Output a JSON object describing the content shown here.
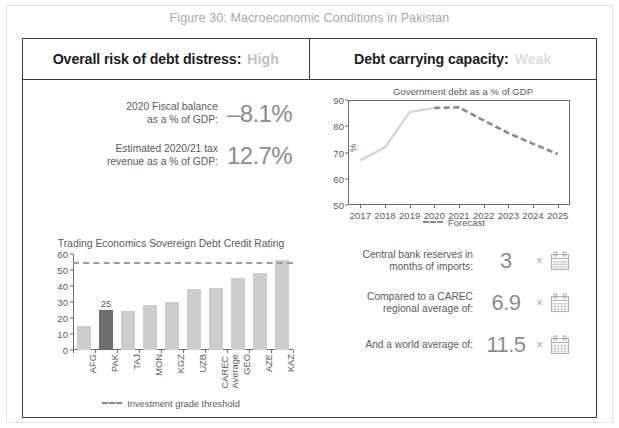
{
  "figure": {
    "title": "Figure 30: Macroeconomic Conditions in Pakistan"
  },
  "header": {
    "left_label": "Overall risk of debt distress:",
    "left_value": "High",
    "right_label": "Debt carrying capacity:",
    "right_value": "Weak"
  },
  "stats": [
    {
      "label_line1": "2020 Fiscal balance",
      "label_line2": "as a % of GDP:",
      "value": "–8.1%"
    },
    {
      "label_line1": "Estimated 2020/21 tax",
      "label_line2": "revenue as a % of GDP:",
      "value": "12.7%"
    }
  ],
  "reserves": [
    {
      "label_line1": "Central bank reserves in",
      "label_line2": "months of imports:",
      "value": "3",
      "multiplier": "×",
      "icon": "calendar-icon"
    },
    {
      "label_line1": "Compared to a CAREC",
      "label_line2": "regional average of:",
      "value": "6.9",
      "multiplier": "×",
      "icon": "calendar-icon"
    },
    {
      "label_line1": "And a world average of:",
      "label_line2": "",
      "value": "11.5",
      "multiplier": "×",
      "icon": "calendar-icon"
    }
  ],
  "colors": {
    "frame": "#3c3c3c",
    "text": "#5a5a5a",
    "value_gray": "#8c8c8c",
    "bar_default": "#cdcdcd",
    "bar_highlight": "#6e6e6e",
    "line_actual": "#d5d5d5",
    "line_forecast": "#8a8a8a"
  },
  "chart_data": [
    {
      "id": "government-debt-line-chart",
      "type": "line",
      "title": "Government debt as a % of GDP",
      "xlabel": "",
      "ylabel": "%",
      "ylim": [
        50,
        90
      ],
      "yticks": [
        50,
        60,
        70,
        80,
        90
      ],
      "x": [
        "2017",
        "2018",
        "2019",
        "2020",
        "2021",
        "2022",
        "2023",
        "2024",
        "2025"
      ],
      "grid": false,
      "legend_position": "bottom",
      "series": [
        {
          "name": "Actual",
          "style": "solid",
          "color": "#d5d5d5",
          "x": [
            "2017",
            "2018",
            "2019",
            "2020"
          ],
          "values": [
            67.0,
            72.0,
            85.4,
            87.0
          ]
        },
        {
          "name": "Forecast",
          "style": "dashed",
          "color": "#8a8a8a",
          "x": [
            "2020",
            "2021",
            "2022",
            "2023",
            "2024",
            "2025"
          ],
          "values": [
            87.0,
            87.2,
            82.2,
            77.4,
            73.3,
            69.4
          ]
        }
      ],
      "legend": [
        "Forecast"
      ]
    },
    {
      "id": "sovereign-debt-credit-rating-bar-chart",
      "type": "bar",
      "title": "Trading Economics Sovereign Debt Credit Rating",
      "xlabel": "",
      "ylabel": "",
      "ylim": [
        0,
        60
      ],
      "yticks": [
        0,
        10,
        20,
        30,
        40,
        50,
        60
      ],
      "categories": [
        "AFG",
        "PAK",
        "TAJ",
        "MON",
        "KGZ",
        "UZB",
        "CAREC Average",
        "GEO",
        "AZE",
        "KAZ"
      ],
      "values": [
        15,
        25,
        24.5,
        28,
        30,
        38,
        39,
        45,
        48,
        56
      ],
      "highlight_index": 1,
      "data_labels": {
        "PAK": "25"
      },
      "threshold": {
        "value": 55,
        "label": "Investment grade threshold",
        "style": "dashed"
      },
      "legend": [
        "Investment grade threshold"
      ],
      "legend_position": "bottom",
      "grid": false
    }
  ]
}
